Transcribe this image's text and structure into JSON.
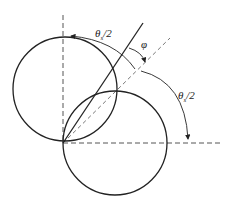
{
  "diagram": {
    "title": "",
    "labels": {
      "top_angle": {
        "symbol": "θ",
        "subscript": "s",
        "suffix": "/2"
      },
      "right_angle": {
        "symbol": "θ",
        "subscript": "s",
        "suffix": "/2"
      },
      "phi": "φ"
    },
    "elements": [
      {
        "type": "circle",
        "name": "upper-circle"
      },
      {
        "type": "circle",
        "name": "lower-circle"
      },
      {
        "type": "line",
        "name": "vertical-dashed-axis"
      },
      {
        "type": "line",
        "name": "horizontal-dashed-axis"
      },
      {
        "type": "line",
        "name": "diagonal-dashed-line"
      },
      {
        "type": "line",
        "name": "solid-inclined-line"
      },
      {
        "type": "arc-arrow",
        "name": "top-theta-arc"
      },
      {
        "type": "arc-arrow",
        "name": "right-theta-arc"
      },
      {
        "type": "arc-arrow",
        "name": "phi-arc"
      }
    ],
    "colors": {
      "stroke": "#222222",
      "dashed": "#555555",
      "background": "#ffffff"
    }
  }
}
